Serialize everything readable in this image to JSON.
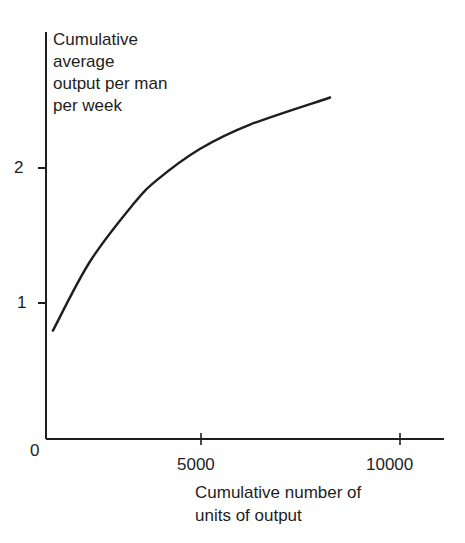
{
  "chart_data": {
    "type": "line",
    "title": "",
    "ylabel": "Cumulative average output per man per week",
    "ylabel_lines": [
      "Cumulative",
      "average",
      "output per man",
      "per week"
    ],
    "xlabel": "Cumulative number of units of output",
    "xlabel_lines": [
      "Cumulative number of",
      "units of output"
    ],
    "x_ticks": [
      5000,
      10000
    ],
    "x_tick_labels": [
      "5000",
      "10000"
    ],
    "y_ticks": [
      1,
      2
    ],
    "y_tick_labels": [
      "1",
      "2"
    ],
    "origin_label": "0",
    "xlim": [
      1100,
      11000
    ],
    "ylim": [
      0,
      2.9
    ],
    "grid": false,
    "legend": null,
    "series": [
      {
        "name": "Learning curve",
        "x": [
          1280,
          2210,
          3290,
          3890,
          4970,
          6230,
          8240
        ],
        "y": [
          0.8,
          1.31,
          1.73,
          1.91,
          2.14,
          2.32,
          2.52
        ]
      }
    ]
  },
  "colors": {
    "ink": "#1e1e1e",
    "background": "#ffffff"
  }
}
